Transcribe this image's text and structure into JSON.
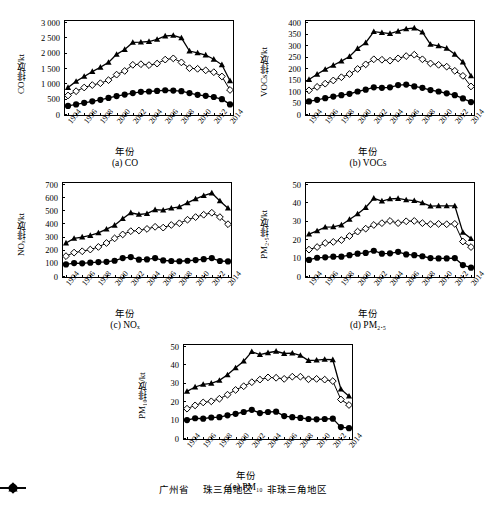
{
  "figure": {
    "xlabel": "年份",
    "xticks": [
      "1994",
      "1996",
      "1998",
      "2000",
      "2002",
      "2004",
      "2006",
      "2008",
      "2010",
      "2012",
      "2014"
    ],
    "legend": [
      {
        "label": "广州省",
        "marker": "filled-triangle"
      },
      {
        "label": "珠三角地区",
        "marker": "open-diamond"
      },
      {
        "label": "非珠三角地区",
        "marker": "filled-circle"
      }
    ]
  },
  "chart_data": [
    {
      "type": "line",
      "panel": "a",
      "caption": "(a) CO",
      "title": "",
      "ylabel": "CO排放/kt",
      "xlabel": "年份",
      "ylim": [
        0,
        3000
      ],
      "yticks": [
        0,
        500,
        1000,
        1500,
        2000,
        2500,
        3000
      ],
      "ytick_labels": [
        "0",
        "500",
        "1 000",
        "1 500",
        "2 000",
        "2 500",
        "3 000"
      ],
      "x": [
        1994,
        1995,
        1996,
        1997,
        1998,
        1999,
        2000,
        2001,
        2002,
        2003,
        2004,
        2005,
        2006,
        2007,
        2008,
        2009,
        2010,
        2011,
        2012,
        2013,
        2014
      ],
      "series": [
        {
          "name": "广州省",
          "values": [
            880,
            1080,
            1240,
            1400,
            1540,
            1700,
            1960,
            2120,
            2350,
            2360,
            2380,
            2450,
            2560,
            2580,
            2500,
            2070,
            2010,
            1940,
            1800,
            1620,
            1100
          ]
        },
        {
          "name": "珠三角地区",
          "values": [
            620,
            760,
            880,
            960,
            1020,
            1120,
            1300,
            1420,
            1620,
            1640,
            1610,
            1660,
            1790,
            1830,
            1700,
            1510,
            1490,
            1440,
            1380,
            1240,
            800
          ]
        },
        {
          "name": "非珠三角地区",
          "values": [
            280,
            330,
            380,
            430,
            480,
            540,
            600,
            650,
            700,
            740,
            750,
            770,
            790,
            780,
            760,
            700,
            640,
            610,
            570,
            500,
            330
          ]
        }
      ]
    },
    {
      "type": "line",
      "panel": "b",
      "caption": "(b) VOCs",
      "title": "",
      "ylabel": "VOCs排放/kt",
      "xlabel": "年份",
      "ylim": [
        0,
        400
      ],
      "yticks": [
        0,
        50,
        100,
        150,
        200,
        250,
        300,
        350,
        400
      ],
      "ytick_labels": [
        "0",
        "50",
        "100",
        "150",
        "200",
        "250",
        "300",
        "350",
        "400"
      ],
      "x": [
        1994,
        1995,
        1996,
        1997,
        1998,
        1999,
        2000,
        2001,
        2002,
        2003,
        2004,
        2005,
        2006,
        2007,
        2008,
        2009,
        2010,
        2011,
        2012,
        2013,
        2014
      ],
      "series": [
        {
          "name": "广州省",
          "values": [
            152,
            175,
            196,
            214,
            232,
            252,
            287,
            312,
            360,
            356,
            352,
            362,
            372,
            376,
            358,
            305,
            298,
            288,
            262,
            228,
            168
          ]
        },
        {
          "name": "珠三角地区",
          "values": [
            105,
            120,
            134,
            148,
            162,
            176,
            198,
            218,
            240,
            238,
            234,
            244,
            254,
            260,
            240,
            222,
            216,
            208,
            190,
            168,
            122
          ]
        },
        {
          "name": "非珠三角地区",
          "values": [
            57,
            64,
            71,
            78,
            84,
            90,
            100,
            108,
            118,
            116,
            118,
            128,
            130,
            122,
            116,
            106,
            100,
            92,
            84,
            70,
            54
          ]
        }
      ]
    },
    {
      "type": "line",
      "panel": "c",
      "caption": "(c) NOₓ",
      "title": "",
      "ylabel": "NOₓ排放/kt",
      "xlabel": "年份",
      "ylim": [
        0,
        700
      ],
      "yticks": [
        0,
        100,
        200,
        300,
        400,
        500,
        600,
        700
      ],
      "ytick_labels": [
        "0",
        "100",
        "200",
        "300",
        "400",
        "500",
        "600",
        "700"
      ],
      "x": [
        1994,
        1995,
        1996,
        1997,
        1998,
        1999,
        2000,
        2001,
        2002,
        2003,
        2004,
        2005,
        2006,
        2007,
        2008,
        2009,
        2010,
        2011,
        2012,
        2013,
        2014
      ],
      "series": [
        {
          "name": "广州省",
          "values": [
            255,
            290,
            300,
            312,
            332,
            360,
            390,
            440,
            485,
            472,
            478,
            508,
            505,
            520,
            530,
            560,
            590,
            615,
            635,
            575,
            520
          ]
        },
        {
          "name": "珠三角地区",
          "values": [
            155,
            182,
            192,
            205,
            225,
            255,
            290,
            320,
            345,
            350,
            362,
            378,
            372,
            392,
            405,
            432,
            452,
            470,
            485,
            452,
            398
          ]
        },
        {
          "name": "非珠三角地区",
          "values": [
            92,
            102,
            100,
            105,
            110,
            112,
            120,
            140,
            148,
            128,
            130,
            140,
            122,
            118,
            116,
            120,
            125,
            132,
            140,
            118,
            115
          ]
        }
      ]
    },
    {
      "type": "line",
      "panel": "d",
      "caption": "(d) PM₂.₅",
      "title": "",
      "ylabel": "PM₂.₅排放/kt",
      "xlabel": "年份",
      "ylim": [
        0,
        50
      ],
      "yticks": [
        0,
        10,
        20,
        30,
        40,
        50
      ],
      "ytick_labels": [
        "0",
        "10",
        "20",
        "30",
        "40",
        "50"
      ],
      "x": [
        1994,
        1995,
        1996,
        1997,
        1998,
        1999,
        2000,
        2001,
        2002,
        2003,
        2004,
        2005,
        2006,
        2007,
        2008,
        2009,
        2010,
        2011,
        2012,
        2013,
        2014
      ],
      "series": [
        {
          "name": "广州省",
          "values": [
            23.0,
            24.8,
            26.8,
            27.0,
            28.0,
            31.0,
            34.0,
            37.5,
            42.5,
            41.0,
            42.2,
            42.4,
            41.6,
            41.2,
            40.0,
            38.2,
            38.4,
            38.4,
            38.4,
            24.0,
            20.6
          ]
        },
        {
          "name": "珠三角地区",
          "values": [
            14.6,
            16.0,
            18.2,
            18.8,
            19.8,
            22.0,
            24.4,
            26.0,
            28.0,
            29.0,
            30.2,
            29.0,
            30.0,
            30.2,
            29.0,
            28.4,
            28.6,
            28.4,
            28.6,
            19.0,
            16.0
          ]
        },
        {
          "name": "非珠三角地区",
          "values": [
            9.0,
            10.2,
            10.4,
            10.8,
            10.8,
            11.6,
            12.4,
            12.8,
            14.0,
            12.4,
            12.6,
            13.4,
            12.0,
            11.6,
            11.0,
            10.0,
            9.8,
            9.8,
            10.0,
            6.2,
            4.8
          ]
        }
      ]
    },
    {
      "type": "line",
      "panel": "e",
      "caption": "(e) PM₁₀",
      "title": "",
      "ylabel": "PM₁₀排放/kt",
      "xlabel": "年份",
      "ylim": [
        0,
        50
      ],
      "yticks": [
        0,
        10,
        20,
        30,
        40,
        50
      ],
      "ytick_labels": [
        "0",
        "10",
        "20",
        "30",
        "40",
        "50"
      ],
      "x": [
        1994,
        1995,
        1996,
        1997,
        1998,
        1999,
        2000,
        2001,
        2002,
        2003,
        2004,
        2005,
        2006,
        2007,
        2008,
        2009,
        2010,
        2011,
        2012,
        2013,
        2014
      ],
      "series": [
        {
          "name": "广州省",
          "values": [
            25.6,
            28.0,
            29.4,
            30.0,
            31.6,
            34.6,
            38.4,
            42.0,
            47.2,
            45.6,
            46.6,
            47.4,
            46.2,
            46.4,
            45.2,
            42.4,
            42.6,
            43.0,
            42.8,
            26.8,
            23.0
          ]
        },
        {
          "name": "珠三角地区",
          "values": [
            16.2,
            18.0,
            19.6,
            20.2,
            21.6,
            23.8,
            26.4,
            28.4,
            30.6,
            32.0,
            33.2,
            33.0,
            32.4,
            33.6,
            33.6,
            32.2,
            32.4,
            32.0,
            31.2,
            21.2,
            18.2
          ]
        },
        {
          "name": "非珠三角地区",
          "values": [
            10.0,
            11.0,
            10.8,
            11.4,
            11.6,
            12.6,
            13.4,
            14.4,
            15.6,
            13.8,
            14.4,
            14.6,
            12.2,
            11.6,
            11.2,
            10.6,
            10.4,
            10.6,
            10.8,
            6.2,
            5.6
          ]
        }
      ]
    }
  ]
}
